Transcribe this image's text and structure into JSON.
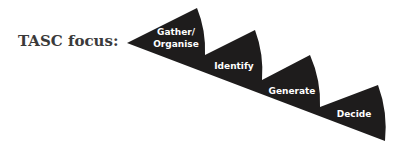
{
  "title": "TASC focus:",
  "colors": {
    "shape": "#1e1c1c",
    "label": "#ffffff",
    "title": "#3a3a3a"
  },
  "steps": [
    {
      "line1": "Gather/",
      "line2": "Organise"
    },
    {
      "line1": "Identify"
    },
    {
      "line1": "Generate"
    },
    {
      "line1": "Decide"
    }
  ]
}
